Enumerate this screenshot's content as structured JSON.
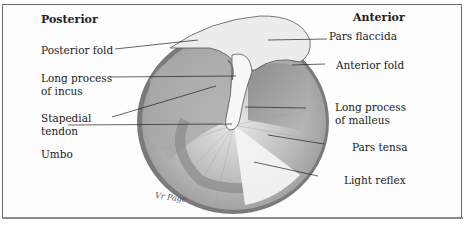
{
  "figure": {
    "orientation": {
      "left": "Posterior",
      "right": "Anterior"
    },
    "labels_left": [
      {
        "id": "posterior-fold",
        "text": "Posterior fold"
      },
      {
        "id": "long-process-incus-1",
        "text": "Long process"
      },
      {
        "id": "long-process-incus-2",
        "text": "of incus"
      },
      {
        "id": "stapedial-tendon-1",
        "text": "Stapedial"
      },
      {
        "id": "stapedial-tendon-2",
        "text": "tendon"
      },
      {
        "id": "umbo",
        "text": "Umbo"
      }
    ],
    "labels_right": [
      {
        "id": "pars-flaccida",
        "text": "Pars flaccida"
      },
      {
        "id": "anterior-fold",
        "text": "Anterior fold"
      },
      {
        "id": "long-process-malleus-1",
        "text": "Long process"
      },
      {
        "id": "long-process-malleus-2",
        "text": "of malleus"
      },
      {
        "id": "pars-tensa",
        "text": "Pars tensa"
      },
      {
        "id": "light-reflex",
        "text": "Light reflex"
      }
    ],
    "signature": "Vr Page"
  }
}
